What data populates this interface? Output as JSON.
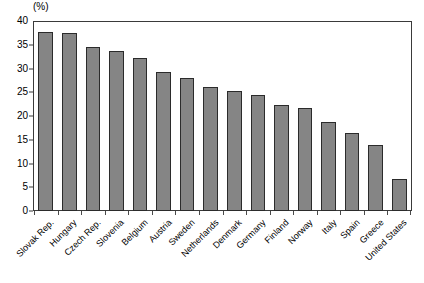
{
  "chart_data": {
    "type": "bar",
    "title": "",
    "subtitle": "",
    "unit_label": "(%)",
    "xlabel": "",
    "ylabel": "",
    "ylim": [
      0,
      40
    ],
    "yticks": [
      0,
      5,
      10,
      15,
      20,
      25,
      30,
      35,
      40
    ],
    "ytick_labels": [
      "0",
      "5",
      "10",
      "15",
      "20",
      "25",
      "30",
      "35",
      "40"
    ],
    "grid": false,
    "legend": false,
    "bar_color": "#858585",
    "bar_edge_color": "#2b2b2b",
    "axis_color": "#3a3a3a",
    "categories": [
      "Slovak Rep.",
      "Hungary",
      "Czech Rep.",
      "Slovenia",
      "Belgium",
      "Austria",
      "Sweden",
      "Netherlands",
      "Denmark",
      "Germany",
      "Finland",
      "Norway",
      "Italy",
      "Spain",
      "Greece",
      "United States"
    ],
    "values": [
      37.9,
      37.6,
      34.8,
      33.8,
      32.3,
      29.5,
      28.1,
      26.3,
      25.4,
      24.5,
      22.5,
      21.9,
      18.9,
      16.6,
      14.0,
      6.7
    ]
  }
}
